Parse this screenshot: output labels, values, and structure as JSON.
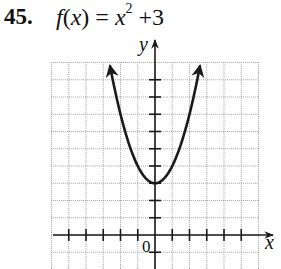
{
  "problem": {
    "number": "45.",
    "function_name": "f",
    "variable": "x",
    "lhs": "f(x)",
    "equals": "=",
    "base": "x",
    "exponent": "2",
    "rest": "+3"
  },
  "axes": {
    "x_label": "x",
    "y_label": "y",
    "origin_label": "0"
  },
  "colors": {
    "curve": "#1a1a1a",
    "grid": "#9a9a9a",
    "axis": "#1a1a1a",
    "background": "#ffffff"
  },
  "chart_data": {
    "type": "line",
    "xlabel": "x",
    "ylabel": "y",
    "xlim": [
      -6,
      6
    ],
    "ylim": [
      -2,
      10
    ],
    "grid": true,
    "tick_step": 1,
    "origin_label": "0",
    "legend": null,
    "function": "x^2 + 3",
    "vertex": [
      0,
      3
    ],
    "series": [
      {
        "name": "f(x) = x^2 + 3",
        "x": [
          -2.6,
          -2,
          -1.5,
          -1,
          -0.5,
          0,
          0.5,
          1,
          1.5,
          2,
          2.6
        ],
        "y": [
          9.76,
          7,
          5.25,
          4,
          3.25,
          3,
          3.25,
          4,
          5.25,
          7,
          9.76
        ]
      }
    ],
    "arrows_on_curve_ends": true
  }
}
